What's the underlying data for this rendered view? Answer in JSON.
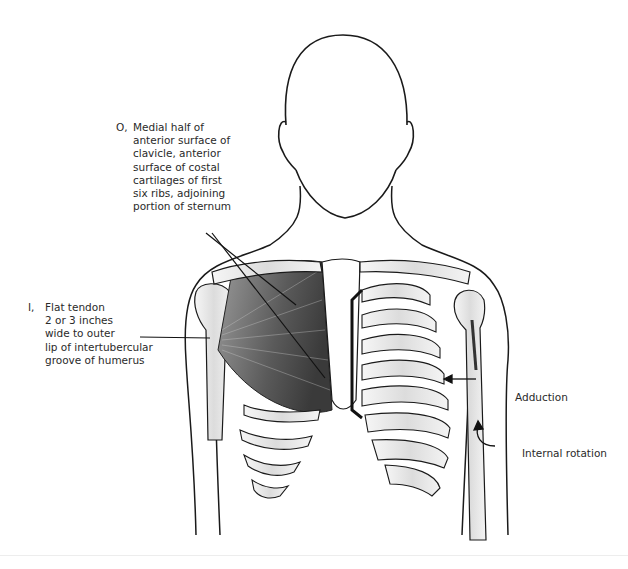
{
  "figure": {
    "colors": {
      "background": "#ffffff",
      "outline": "#1a1a1a",
      "muscle_shade": "#555555",
      "bone_fill": "#ececec"
    }
  },
  "labels": {
    "origin": {
      "prefix": "O,",
      "text": "Medial half of\nanterior surface of\nclavicle, anterior\nsurface of costal\ncartilages of first\nsix ribs, adjoining\nportion of sternum"
    },
    "insertion": {
      "prefix": "I,",
      "text": "Flat tendon\n2 or 3 inches\nwide to outer\nlip of intertubercular\ngroove of humerus"
    },
    "actions": [
      {
        "text": "Adduction"
      },
      {
        "text": "Internal rotation"
      }
    ]
  }
}
